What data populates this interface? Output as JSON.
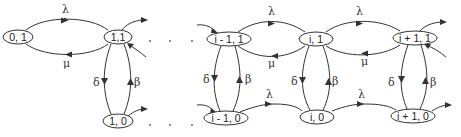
{
  "diagram": {
    "type": "state-transition-diagram",
    "colors": {
      "stroke": "#333333",
      "background": "#ffffff"
    },
    "nodes": [
      {
        "id": "n01",
        "label": "0, 1",
        "x": 18,
        "y": 37,
        "rx": 16
      },
      {
        "id": "n11",
        "label": "1,1",
        "x": 118,
        "y": 37,
        "rx": 14
      },
      {
        "id": "n10",
        "label": "1, 0",
        "x": 118,
        "y": 121,
        "rx": 16
      },
      {
        "id": "nim11",
        "label": "i - 1, 1",
        "x": 229,
        "y": 39,
        "rx": 22
      },
      {
        "id": "ni1",
        "label": "i, 1",
        "x": 316,
        "y": 39,
        "rx": 17
      },
      {
        "id": "nip11",
        "label": "i + 1, 1",
        "x": 415,
        "y": 38,
        "rx": 22
      },
      {
        "id": "nim10",
        "label": "i - 1, 0",
        "x": 226,
        "y": 118,
        "rx": 22
      },
      {
        "id": "ni0",
        "label": "i, 0",
        "x": 317,
        "y": 117,
        "rx": 17
      },
      {
        "id": "nip10",
        "label": "i + 1, 0",
        "x": 413,
        "y": 116,
        "rx": 22
      }
    ],
    "edge_labels": {
      "lambda": "λ",
      "mu": "μ",
      "delta": "δ",
      "beta": "β"
    },
    "edges": [
      {
        "from": "0, 1",
        "to": "1,1",
        "label": "λ"
      },
      {
        "from": "1,1",
        "to": "0, 1",
        "label": "μ"
      },
      {
        "from": "1,1",
        "to": "1, 0",
        "label": "δ"
      },
      {
        "from": "1, 0",
        "to": "1,1",
        "label": "β"
      },
      {
        "from": "i - 1, 1",
        "to": "i, 1",
        "label": "λ"
      },
      {
        "from": "i, 1",
        "to": "i - 1, 1",
        "label": "μ"
      },
      {
        "from": "i - 1, 1",
        "to": "i - 1, 0",
        "label": "δ"
      },
      {
        "from": "i - 1, 0",
        "to": "i - 1, 1",
        "label": "β"
      },
      {
        "from": "i, 1",
        "to": "i + 1, 1",
        "label": "λ"
      },
      {
        "from": "i + 1, 1",
        "to": "i, 1",
        "label": "μ"
      },
      {
        "from": "i, 1",
        "to": "i, 0",
        "label": "δ"
      },
      {
        "from": "i, 0",
        "to": "i, 1",
        "label": "β"
      },
      {
        "from": "i + 1, 1",
        "to": "i + 1, 0",
        "label": "δ"
      },
      {
        "from": "i + 1, 0",
        "to": "i + 1, 1",
        "label": "β"
      },
      {
        "from": "i - 1, 0",
        "to": "i, 0",
        "label": "λ"
      },
      {
        "from": "i, 0",
        "to": "i + 1, 0",
        "label": "λ"
      }
    ],
    "ellipsis": "· · ·"
  }
}
